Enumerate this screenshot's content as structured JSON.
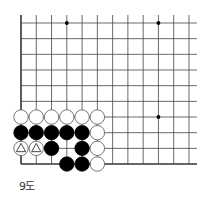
{
  "diagram": {
    "caption": "9도",
    "board": {
      "columns": 12,
      "rows": 10,
      "origin_x": 21,
      "origin_y": 23,
      "spacing_x": 15.27,
      "spacing_y": 15.67,
      "left_edge": true,
      "bottom_edge": true,
      "right_extend": 8,
      "top_extend": 8,
      "star_points": [
        [
          3,
          0
        ],
        [
          9,
          0
        ],
        [
          9,
          6
        ],
        [
          3,
          6
        ]
      ]
    },
    "stones": [
      {
        "col": 0,
        "row": 6,
        "color": "white"
      },
      {
        "col": 1,
        "row": 6,
        "color": "white"
      },
      {
        "col": 2,
        "row": 6,
        "color": "white"
      },
      {
        "col": 3,
        "row": 6,
        "color": "white"
      },
      {
        "col": 4,
        "row": 6,
        "color": "white"
      },
      {
        "col": 5,
        "row": 6,
        "color": "white"
      },
      {
        "col": 0,
        "row": 7,
        "color": "black"
      },
      {
        "col": 1,
        "row": 7,
        "color": "black"
      },
      {
        "col": 2,
        "row": 7,
        "color": "black"
      },
      {
        "col": 3,
        "row": 7,
        "color": "black"
      },
      {
        "col": 4,
        "row": 7,
        "color": "black"
      },
      {
        "col": 5,
        "row": 7,
        "color": "white"
      },
      {
        "col": 0,
        "row": 8,
        "color": "white",
        "mark": "triangle"
      },
      {
        "col": 1,
        "row": 8,
        "color": "white",
        "mark": "triangle"
      },
      {
        "col": 2,
        "row": 8,
        "color": "black"
      },
      {
        "col": 4,
        "row": 8,
        "color": "black"
      },
      {
        "col": 5,
        "row": 8,
        "color": "white"
      },
      {
        "col": 3,
        "row": 9,
        "color": "black"
      },
      {
        "col": 4,
        "row": 9,
        "color": "black"
      },
      {
        "col": 5,
        "row": 9,
        "color": "white"
      }
    ],
    "colors": {
      "line": "#444444",
      "edge": "#333333",
      "black_stone": "#000000",
      "white_stone": "#ffffff",
      "stone_outline": "#555555"
    }
  }
}
